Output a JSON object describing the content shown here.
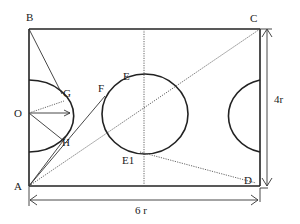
{
  "diagram": {
    "type": "geometry-field-layout",
    "labels": {
      "B": "B",
      "C": "C",
      "O": "O",
      "G": "G",
      "F": "F",
      "E": "E",
      "H": "H",
      "E1": "E1",
      "A": "A",
      "D": "D"
    },
    "dimensions": {
      "width_label": "6 r",
      "height_label": "4r"
    },
    "colors": {
      "stroke": "#222222",
      "background": "#ffffff"
    }
  }
}
